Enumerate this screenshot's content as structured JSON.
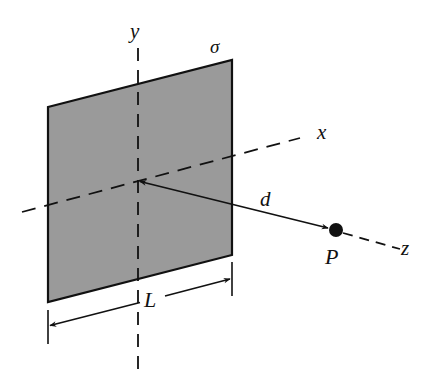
{
  "figure": {
    "type": "physics-diagram",
    "labels": {
      "y_axis": "y",
      "x_axis": "x",
      "z_axis": "z",
      "charge_density": "σ",
      "distance": "d",
      "point": "P",
      "side_length": "L"
    },
    "colors": {
      "plate_fill": "#9a9a9a",
      "stroke": "#111111",
      "background": "#ffffff"
    },
    "geometry": {
      "origin": [
        138,
        181
      ],
      "plate_corners": [
        [
          48,
          107
        ],
        [
          232,
          60
        ],
        [
          232,
          255
        ],
        [
          48,
          302
        ]
      ],
      "point_P": [
        336,
        230
      ],
      "point_radius": 7
    }
  }
}
